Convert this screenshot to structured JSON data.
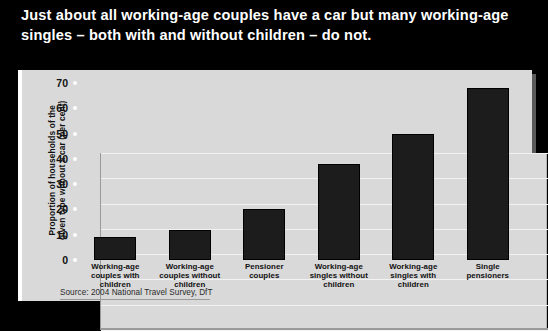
{
  "title": "Just about all working-age couples have a car but many working-age singles – both with and without children – do not.",
  "source": "Source: 2004 National Travel Survey, DfT",
  "colors": {
    "banner_background": "#000000",
    "banner_text": "#ffffff",
    "plot_background": "#d9d9d9",
    "bar_fill": "#1c1c1c",
    "gridline": "#f2f2f2",
    "axis_text": "#111111"
  },
  "chart_data": {
    "type": "bar",
    "title": "Just about all working-age couples have a car but many working-age singles – both with and without children – do not.",
    "xlabel": "",
    "ylabel": "Proportion of households of the given type without a car (per cent)",
    "ylabel_line1": "Proportion of households of the",
    "ylabel_line2": "given type without a car (per cent)",
    "categories": [
      "Working-age couples with children",
      "Working-age couples without children",
      "Pensioner couples",
      "Working-age singles without children",
      "Working-age singles with children",
      "Single pensioners"
    ],
    "category_lines": [
      [
        "Working-age",
        "couples with",
        "children"
      ],
      [
        "Working-age",
        "couples without",
        "children"
      ],
      [
        "Pensioner",
        "couples"
      ],
      [
        "Working-age",
        "singles without",
        "children"
      ],
      [
        "Working-age",
        "singles with",
        "children"
      ],
      [
        "Single",
        "pensioners"
      ]
    ],
    "values": [
      9,
      12,
      20,
      38,
      50,
      68
    ],
    "ylim": [
      0,
      70
    ],
    "yticks": [
      0,
      10,
      20,
      30,
      40,
      50,
      60,
      70
    ],
    "ytick_labels": [
      "0",
      "10",
      "20",
      "30",
      "40",
      "50",
      "60",
      "70"
    ],
    "grid": true,
    "legend": false,
    "source": "Source: 2004 National Travel Survey, DfT"
  }
}
